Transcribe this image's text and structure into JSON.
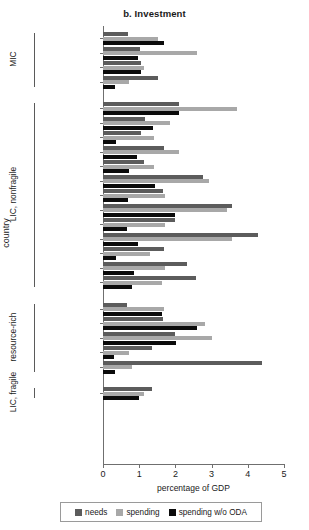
{
  "chart_data": {
    "type": "bar",
    "title": "b. Investment",
    "xlabel": "percentage of GDP",
    "ylabel": "country",
    "xlim": [
      0,
      5
    ],
    "xticks": [
      0,
      1,
      2,
      3,
      4,
      5
    ],
    "orientation": "horizontal",
    "grid": false,
    "legend_position": "bottom",
    "series": [
      {
        "name": "needs",
        "color": "#5c5c5c"
      },
      {
        "name": "spending",
        "color": "#a8a8a8"
      },
      {
        "name": "spending w/o ODA",
        "color": "#0b0b0b"
      }
    ],
    "groups": [
      {
        "label": "MIC",
        "categories": [
          "Botswana",
          "Lesotho",
          "South Africa",
          "Namibia"
        ],
        "values": {
          "needs": [
            0.69,
            1.03,
            1.06,
            1.51
          ],
          "spending": [
            1.51,
            2.6,
            1.14,
            0.71
          ],
          "spending w/o ODA": [
            1.69,
            0.97,
            1.06,
            0.34
          ]
        }
      },
      {
        "label": "LIC, nonfragile",
        "categories": [
          "Ethiopia",
          "Senegal",
          "Rwanda",
          "Malawi",
          "Kenya",
          "Mali",
          "Ghana",
          "Mozambique",
          "Benin",
          "Madagascar",
          "Uganda",
          "Niger",
          "Tanzania"
        ],
        "values": {
          "needs": [
            2.11,
            1.17,
            1.06,
            1.69,
            1.14,
            2.77,
            1.66,
            3.57,
            2.0,
            4.29,
            1.69,
            2.31,
            2.57
          ],
          "spending": [
            3.71,
            1.86,
            1.4,
            2.09,
            1.4,
            2.94,
            1.71,
            3.43,
            1.71,
            3.57,
            1.31,
            1.71,
            1.63
          ],
          "spending w/o ODA": [
            2.09,
            1.37,
            0.37,
            0.94,
            0.71,
            1.43,
            0.69,
            2.0,
            0.66,
            0.97,
            0.37,
            0.86,
            0.8
          ]
        }
      },
      {
        "label": "resource-rich",
        "categories": [
          "Nigeria",
          "Congo, Rep.",
          "Zambia",
          "Cameroon",
          "Chad"
        ],
        "values": {
          "needs": [
            0.66,
            1.66,
            2.0,
            1.34,
            4.4
          ],
          "spending": [
            1.69,
            2.83,
            3.0,
            0.71,
            0.8
          ],
          "spending w/o ODA": [
            1.63,
            2.6,
            2.03,
            0.31,
            0.34
          ]
        }
      },
      {
        "label": "LIC, fragile",
        "categories": [
          "Côte d'Ivoire"
        ],
        "values": {
          "needs": [
            1.34
          ],
          "spending": [
            1.14
          ],
          "spending w/o ODA": [
            1.0
          ]
        }
      }
    ]
  }
}
